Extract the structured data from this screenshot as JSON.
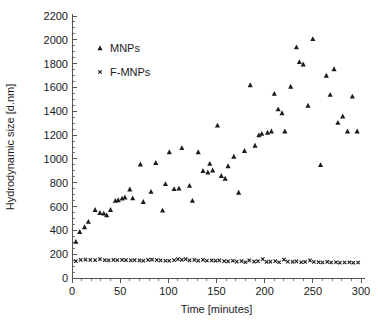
{
  "chart_data": {
    "type": "scatter",
    "title": "",
    "xlabel": "Time [minutes]",
    "ylabel": "Hydrodynamic size  [d.nm]",
    "xlim": [
      0,
      300
    ],
    "ylim": [
      0,
      2200
    ],
    "x_major_step": 50,
    "x_minor_step": 10,
    "y_major_step": 200,
    "y_minor_step": 50,
    "grid": false,
    "legend_position": "upper-left-inside",
    "xticks": [
      0,
      50,
      100,
      150,
      200,
      250,
      300
    ],
    "yticks": [
      0,
      200,
      400,
      600,
      800,
      1000,
      1200,
      1400,
      1600,
      1800,
      2000,
      2200
    ],
    "xtick_labels": [
      "0",
      "50",
      "100",
      "150",
      "200",
      "250",
      "300"
    ],
    "ytick_labels": [
      "0",
      "200",
      "400",
      "600",
      "800",
      "1000",
      "1200",
      "1400",
      "1600",
      "1800",
      "2000",
      "2200"
    ],
    "series": [
      {
        "name": "MNPs",
        "marker": "triangle",
        "color": "#1d1d1d",
        "points": [
          [
            4,
            305
          ],
          [
            8,
            388
          ],
          [
            13,
            428
          ],
          [
            17,
            473
          ],
          [
            24,
            573
          ],
          [
            29,
            548
          ],
          [
            33,
            542
          ],
          [
            36,
            528
          ],
          [
            40,
            573
          ],
          [
            45,
            650
          ],
          [
            48,
            655
          ],
          [
            52,
            668
          ],
          [
            55,
            678
          ],
          [
            60,
            745
          ],
          [
            63,
            670
          ],
          [
            71,
            955
          ],
          [
            74,
            640
          ],
          [
            82,
            725
          ],
          [
            87,
            968
          ],
          [
            94,
            568
          ],
          [
            97,
            790
          ],
          [
            101,
            1058
          ],
          [
            106,
            748
          ],
          [
            111,
            752
          ],
          [
            114,
            1092
          ],
          [
            122,
            775
          ],
          [
            125,
            650
          ],
          [
            131,
            1058
          ],
          [
            136,
            900
          ],
          [
            141,
            888
          ],
          [
            143,
            960
          ],
          [
            146,
            905
          ],
          [
            151,
            1282
          ],
          [
            155,
            858
          ],
          [
            159,
            835
          ],
          [
            162,
            940
          ],
          [
            168,
            1020
          ],
          [
            173,
            718
          ],
          [
            179,
            1068
          ],
          [
            185,
            1620
          ],
          [
            190,
            1112
          ],
          [
            194,
            1200
          ],
          [
            197,
            1212
          ],
          [
            203,
            1222
          ],
          [
            207,
            1232
          ],
          [
            210,
            1548
          ],
          [
            214,
            1418
          ],
          [
            218,
            1385
          ],
          [
            221,
            1232
          ],
          [
            227,
            1608
          ],
          [
            233,
            1938
          ],
          [
            236,
            1815
          ],
          [
            240,
            1795
          ],
          [
            245,
            1448
          ],
          [
            250,
            2008
          ],
          [
            258,
            950
          ],
          [
            264,
            1700
          ],
          [
            268,
            1540
          ],
          [
            272,
            1755
          ],
          [
            276,
            1305
          ],
          [
            281,
            1358
          ],
          [
            286,
            1232
          ],
          [
            291,
            1525
          ],
          [
            296,
            1232
          ]
        ]
      },
      {
        "name": "F-MNPs",
        "marker": "x",
        "color": "#1d1d1d",
        "points": [
          [
            4,
            142
          ],
          [
            9,
            152
          ],
          [
            14,
            155
          ],
          [
            19,
            152
          ],
          [
            24,
            150
          ],
          [
            29,
            158
          ],
          [
            34,
            150
          ],
          [
            38,
            148
          ],
          [
            43,
            152
          ],
          [
            47,
            150
          ],
          [
            52,
            152
          ],
          [
            56,
            150
          ],
          [
            61,
            148
          ],
          [
            65,
            150
          ],
          [
            70,
            148
          ],
          [
            74,
            145
          ],
          [
            79,
            152
          ],
          [
            83,
            155
          ],
          [
            88,
            150
          ],
          [
            92,
            148
          ],
          [
            97,
            145
          ],
          [
            101,
            145
          ],
          [
            106,
            150
          ],
          [
            110,
            158
          ],
          [
            114,
            152
          ],
          [
            118,
            158
          ],
          [
            122,
            148
          ],
          [
            127,
            152
          ],
          [
            131,
            145
          ],
          [
            136,
            152
          ],
          [
            140,
            145
          ],
          [
            145,
            148
          ],
          [
            149,
            145
          ],
          [
            153,
            148
          ],
          [
            158,
            142
          ],
          [
            162,
            140
          ],
          [
            167,
            145
          ],
          [
            171,
            138
          ],
          [
            176,
            142
          ],
          [
            180,
            132
          ],
          [
            184,
            148
          ],
          [
            189,
            138
          ],
          [
            193,
            142
          ],
          [
            198,
            158
          ],
          [
            202,
            135
          ],
          [
            206,
            138
          ],
          [
            211,
            142
          ],
          [
            215,
            132
          ],
          [
            220,
            155
          ],
          [
            224,
            138
          ],
          [
            229,
            135
          ],
          [
            233,
            140
          ],
          [
            238,
            132
          ],
          [
            242,
            135
          ],
          [
            247,
            148
          ],
          [
            251,
            135
          ],
          [
            256,
            132
          ],
          [
            260,
            130
          ],
          [
            265,
            135
          ],
          [
            269,
            130
          ],
          [
            274,
            132
          ],
          [
            278,
            128
          ],
          [
            283,
            130
          ],
          [
            288,
            132
          ],
          [
            292,
            128
          ],
          [
            297,
            130
          ]
        ]
      }
    ],
    "legend_entries": [
      {
        "label": "MNPs",
        "marker": "triangle"
      },
      {
        "label": "F-MNPs",
        "marker": "x"
      }
    ]
  }
}
